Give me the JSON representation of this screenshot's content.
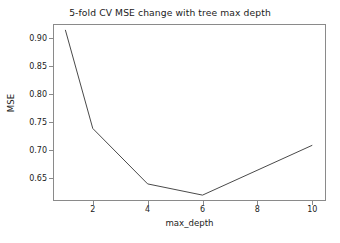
{
  "chart_data": {
    "type": "line",
    "title": "5-fold CV MSE change with tree max depth",
    "xlabel": "max_depth",
    "ylabel": "MSE",
    "x": [
      1,
      2,
      4,
      6,
      10
    ],
    "values": [
      0.914,
      0.738,
      0.639,
      0.619,
      0.708
    ],
    "series": [
      {
        "name": "5-fold CV MSE",
        "x": [
          1,
          2,
          4,
          6,
          10
        ],
        "values": [
          0.914,
          0.738,
          0.639,
          0.619,
          0.708
        ]
      }
    ],
    "xticks": [
      2,
      4,
      6,
      8,
      10
    ],
    "xtick_labels": [
      "2",
      "4",
      "6",
      "8",
      "10"
    ],
    "yticks": [
      0.65,
      0.7,
      0.75,
      0.8,
      0.85,
      0.9
    ],
    "ytick_labels": [
      "0.65",
      "0.70",
      "0.75",
      "0.80",
      "0.85",
      "0.90"
    ],
    "xlim": [
      0.55,
      10.5
    ],
    "ylim": [
      0.6085,
      0.9245
    ],
    "grid": false,
    "legend": null,
    "line_color": "#4a4a4a",
    "line_width": 1.0,
    "frame_color": "#8a8a8a",
    "background": "#ffffff",
    "text_color": "#1b1b1b"
  }
}
